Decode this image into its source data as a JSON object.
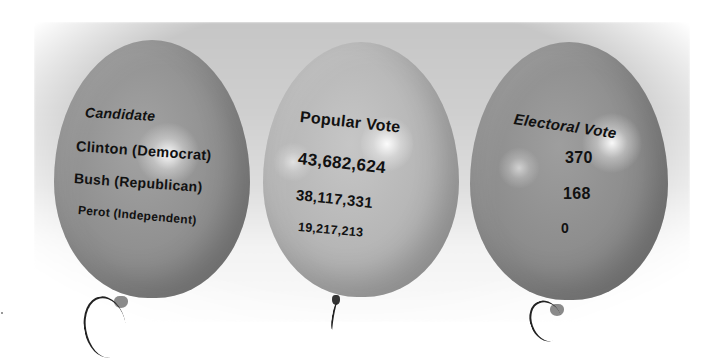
{
  "scene": "Three balloons displaying 1992 US presidential election results",
  "balloons": [
    {
      "header": "Candidate",
      "rows": [
        "Clinton (Democrat)",
        "Bush (Republican)",
        "Perot (Independent)"
      ]
    },
    {
      "header": "Popular Vote",
      "rows": [
        "43,682,624",
        "38,117,331",
        "19,217,213"
      ]
    },
    {
      "header": "Electoral Vote",
      "rows": [
        "370",
        "168",
        "0"
      ]
    }
  ],
  "table": {
    "columns": [
      "Candidate",
      "Popular Vote",
      "Electoral Vote"
    ],
    "rows": [
      [
        "Clinton (Democrat)",
        "43,682,624",
        "370"
      ],
      [
        "Bush (Republican)",
        "38,117,331",
        "168"
      ],
      [
        "Perot (Independent)",
        "19,217,213",
        "0"
      ]
    ]
  },
  "colors": {
    "balloon_left": "#8e8e8e",
    "balloon_middle": "#b4b4b4",
    "balloon_right": "#8b8b8b",
    "backdrop": "#cfcfcf",
    "text": "#111111"
  }
}
